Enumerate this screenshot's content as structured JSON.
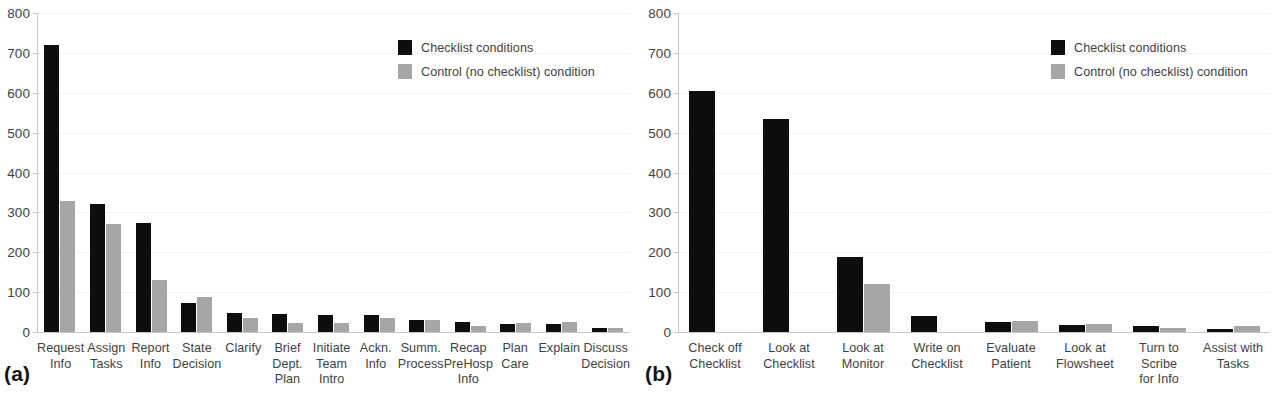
{
  "chart_data": [
    {
      "panel": "(a)",
      "type": "bar",
      "title": "",
      "xlabel": "",
      "ylabel": "",
      "ylim": [
        0,
        800
      ],
      "yticks": [
        0,
        100,
        200,
        300,
        400,
        500,
        600,
        700,
        800
      ],
      "grid": true,
      "legend_position": "upper-right",
      "categories": [
        "Request\nInfo",
        "Assign\nTasks",
        "Report\nInfo",
        "State\nDecision",
        "Clarify",
        "Brief\nDept.\nPlan",
        "Initiate\nTeam\nIntro",
        "Ackn.\nInfo",
        "Summ.\nProcess",
        "Recap\nPreHosp\nInfo",
        "Plan\nCare",
        "Explain",
        "Discuss\nDecision"
      ],
      "series": [
        {
          "name": "Checklist conditions",
          "color": "#0d0d0d",
          "values": [
            720,
            322,
            274,
            74,
            47,
            45,
            43,
            42,
            29,
            25,
            21,
            21,
            11
          ]
        },
        {
          "name": "Control (no checklist) condition",
          "color": "#a6a6a6",
          "values": [
            328,
            270,
            130,
            89,
            36,
            23,
            22,
            36,
            29,
            16,
            22,
            24,
            11
          ]
        }
      ]
    },
    {
      "panel": "(b)",
      "type": "bar",
      "title": "",
      "xlabel": "",
      "ylabel": "",
      "ylim": [
        0,
        800
      ],
      "yticks": [
        0,
        100,
        200,
        300,
        400,
        500,
        600,
        700,
        800
      ],
      "grid": true,
      "legend_position": "upper-right",
      "categories": [
        "Check off\nChecklist",
        "Look at\nChecklist",
        "Look at\nMonitor",
        "Write on\nChecklist",
        "Evaluate\nPatient",
        "Look at\nFlowsheet",
        "Turn to Scribe\nfor Info",
        "Assist with\nTasks"
      ],
      "series": [
        {
          "name": "Checklist conditions",
          "color": "#0d0d0d",
          "values": [
            605,
            533,
            188,
            39,
            25,
            18,
            14,
            8
          ]
        },
        {
          "name": "Control (no checklist) condition",
          "color": "#a6a6a6",
          "values": [
            0,
            0,
            121,
            0,
            28,
            19,
            11,
            16
          ]
        }
      ]
    }
  ],
  "legend": {
    "items": [
      {
        "label": "Checklist conditions",
        "color": "#0d0d0d"
      },
      {
        "label": "Control (no checklist) condition",
        "color": "#a6a6a6"
      }
    ]
  },
  "panel_a": {
    "tag": "(a)"
  },
  "panel_b": {
    "tag": "(b)"
  },
  "axis": {
    "tick_labels": [
      "800",
      "700",
      "600",
      "500",
      "400",
      "300",
      "200",
      "100",
      "0"
    ]
  }
}
